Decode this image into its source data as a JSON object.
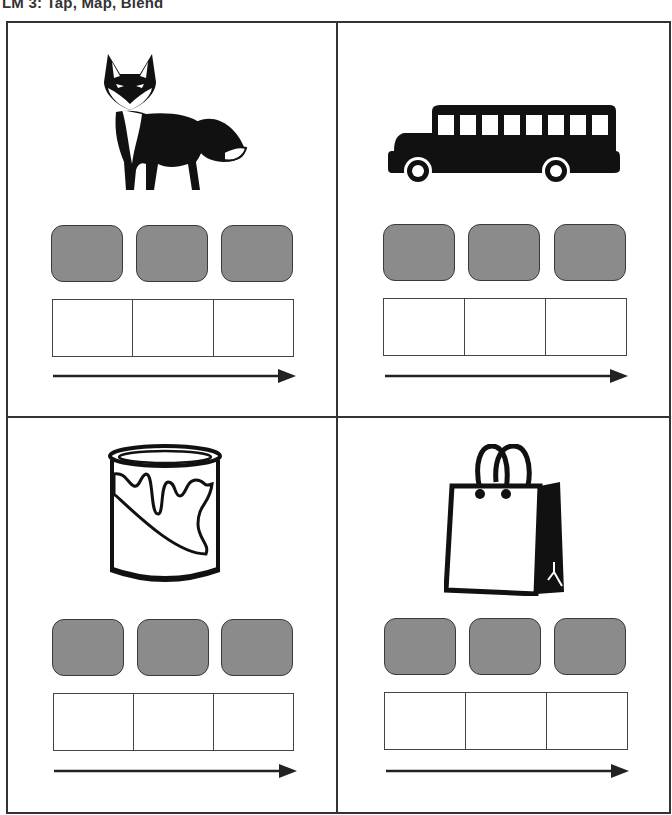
{
  "header": {
    "title": "LM 3: Tap, Map, Blend"
  },
  "colors": {
    "counter_fill": "#8b8b8b",
    "border": "#333333",
    "ink": "#111111"
  },
  "panels": [
    {
      "picture": "fox",
      "icon": "fox-icon",
      "counters": 3,
      "boxes": 3
    },
    {
      "picture": "bus",
      "icon": "bus-icon",
      "counters": 3,
      "boxes": 3
    },
    {
      "picture": "paint can",
      "icon": "paint-can-icon",
      "counters": 3,
      "boxes": 3
    },
    {
      "picture": "shopping bag",
      "icon": "shopping-bag-icon",
      "counters": 3,
      "boxes": 3
    }
  ]
}
